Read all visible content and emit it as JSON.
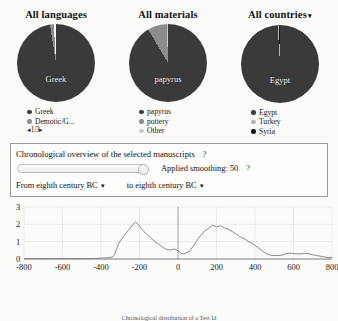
{
  "colors": {
    "primary": "#3a3a3a",
    "secondary": "#8c8c8c",
    "tertiary": "#c9c9c9",
    "quaternary": "#111111",
    "axis": "#6b6b6b",
    "line": "#7d7d7d",
    "grid": "#d8d8d4"
  },
  "panels": [
    {
      "title": "All languages",
      "caret": "▾",
      "has_caret": false,
      "center_label": "Greek",
      "slices": [
        {
          "label": "Greek",
          "value": 97.5,
          "color": "#3a3a3a"
        },
        {
          "label": "Demotic/G...",
          "value": 1.6,
          "color": "#8c8c8c"
        },
        {
          "label": "gap",
          "value": 0.9,
          "color": "#fbfbf9"
        }
      ],
      "legend": [
        {
          "label": "Greek",
          "color": "#3a3a3a"
        },
        {
          "label": "Demotic/G...",
          "color": "#8c8c8c"
        }
      ],
      "pager": "◂1/3▸"
    },
    {
      "title": "All materials",
      "caret": "▾",
      "has_caret": false,
      "center_label": "papyrus",
      "slices": [
        {
          "label": "papyrus",
          "value": 91.5,
          "color": "#3a3a3a"
        },
        {
          "label": "pottery",
          "value": 8.0,
          "color": "#8c8c8c"
        },
        {
          "label": "Other",
          "value": 0.5,
          "color": "#c9c9c9"
        }
      ],
      "legend": [
        {
          "label": "papyrus",
          "color": "#3a3a3a"
        },
        {
          "label": "pottery",
          "color": "#8c8c8c"
        },
        {
          "label": "Other",
          "color": "#c9c9c9"
        }
      ],
      "pager": ""
    },
    {
      "title": "All countries",
      "caret": "▾",
      "has_caret": true,
      "center_label": "Egypt",
      "slices": [
        {
          "label": "Egypt",
          "value": 99.0,
          "color": "#3a3a3a"
        },
        {
          "label": "Turkey",
          "value": 0.6,
          "color": "#b4b4b4"
        },
        {
          "label": "Syria",
          "value": 0.4,
          "color": "#111111"
        }
      ],
      "legend": [
        {
          "label": "Egypt",
          "color": "#3a3a3a"
        },
        {
          "label": "Turkey",
          "color": "#b4b4b4"
        },
        {
          "label": "Syria",
          "color": "#111111"
        }
      ],
      "pager": ""
    }
  ],
  "controls": {
    "title": "Chronological overview of the selected manuscripts",
    "title_help": "?",
    "smoothing_label": "Applied smoothing:",
    "smoothing_value": "50",
    "smoothing_help": "?",
    "slider_percent": 100,
    "from_label": "From eighth century BC",
    "to_label": "to eighth century BC",
    "caret": "▾"
  },
  "caption": "Chronological distribution of a Test Id",
  "chart_data": {
    "type": "line",
    "title": "Chronological overview of the selected manuscripts",
    "xlabel": "",
    "ylabel": "",
    "xlim": [
      -800,
      800
    ],
    "ylim": [
      0,
      3
    ],
    "grid": true,
    "legend": "none",
    "xticks": [
      -800,
      -600,
      -400,
      -200,
      0,
      200,
      400,
      600,
      800
    ],
    "yticks": [
      0,
      1,
      2,
      3
    ],
    "x": [
      -800,
      -760,
      -720,
      -680,
      -640,
      -600,
      -560,
      -520,
      -480,
      -440,
      -400,
      -380,
      -360,
      -340,
      -330,
      -320,
      -310,
      -300,
      -290,
      -280,
      -270,
      -260,
      -250,
      -240,
      -230,
      -220,
      -210,
      -200,
      -190,
      -180,
      -170,
      -160,
      -150,
      -140,
      -130,
      -120,
      -110,
      -100,
      -80,
      -60,
      -40,
      -20,
      0,
      20,
      40,
      60,
      80,
      100,
      120,
      140,
      160,
      180,
      200,
      220,
      240,
      260,
      280,
      300,
      320,
      340,
      360,
      380,
      400,
      420,
      440,
      460,
      480,
      500,
      520,
      540,
      560,
      580,
      600,
      620,
      640,
      660,
      680,
      700,
      720,
      740,
      760,
      780,
      800
    ],
    "y": [
      0.02,
      0.02,
      0.02,
      0.02,
      0.02,
      0.02,
      0.02,
      0.02,
      0.02,
      0.03,
      0.05,
      0.06,
      0.08,
      0.12,
      0.25,
      0.55,
      0.85,
      1.05,
      1.2,
      1.35,
      1.5,
      1.62,
      1.75,
      1.9,
      2.05,
      2.12,
      2.05,
      1.9,
      1.75,
      1.62,
      1.5,
      1.4,
      1.3,
      1.2,
      1.1,
      1.0,
      0.92,
      0.85,
      0.68,
      0.55,
      0.52,
      0.58,
      0.48,
      0.3,
      0.32,
      0.45,
      0.75,
      1.1,
      1.4,
      1.62,
      1.78,
      1.95,
      1.85,
      1.92,
      1.8,
      1.72,
      1.6,
      1.45,
      1.3,
      1.2,
      1.05,
      0.92,
      0.78,
      0.62,
      0.45,
      0.3,
      0.22,
      0.2,
      0.2,
      0.22,
      0.3,
      0.33,
      0.32,
      0.3,
      0.3,
      0.34,
      0.3,
      0.24,
      0.2,
      0.16,
      0.12,
      0.08,
      0.1
    ],
    "vline_x": 0
  }
}
